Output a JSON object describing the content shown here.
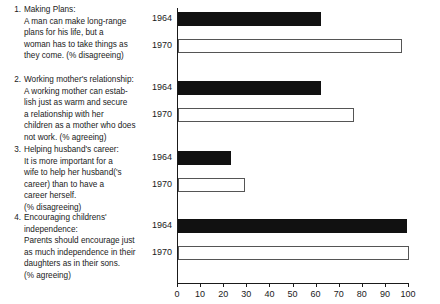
{
  "chart_data": {
    "type": "bar",
    "orientation": "horizontal",
    "title": "",
    "xlabel": "",
    "ylabel": "",
    "xlim": [
      0,
      100
    ],
    "xticks": [
      0,
      10,
      20,
      30,
      40,
      50,
      60,
      70,
      80,
      90,
      100
    ],
    "grid": false,
    "legend": "none",
    "series": [
      {
        "name": "1964",
        "style": "filled",
        "color": "#111111"
      },
      {
        "name": "1970",
        "style": "hollow",
        "color": "#ffffff"
      }
    ],
    "categories": [
      "Making Plans",
      "Working mother's relationship",
      "Helping husband's career",
      "Encouraging childrens' independence"
    ],
    "groups": [
      {
        "number": "1.",
        "title": "Making Plans:",
        "text": "A man can make long-range plans for his life, but a woman has to take things as they come. (% disagreeing)",
        "measure": "% disagreeing",
        "bars": [
          {
            "year": "1964",
            "value": 62,
            "style": "filled"
          },
          {
            "year": "1970",
            "value": 97,
            "style": "hollow"
          }
        ]
      },
      {
        "number": "2.",
        "title": "Working mother's relationship:",
        "text": "A working mother can establish just as warm and secure a relationship with her children as a mother who does not work. (% agreeing)",
        "measure": "% agreeing",
        "bars": [
          {
            "year": "1964",
            "value": 62,
            "style": "filled"
          },
          {
            "year": "1970",
            "value": 76,
            "style": "hollow"
          }
        ]
      },
      {
        "number": "3.",
        "title": "Helping husband's career:",
        "text": "It is more important for a wife to help her husband('s career) than to have a career herself. (% disagreeing)",
        "measure": "% disagreeing",
        "bars": [
          {
            "year": "1964",
            "value": 23,
            "style": "filled"
          },
          {
            "year": "1970",
            "value": 29,
            "style": "hollow"
          }
        ]
      },
      {
        "number": "4.",
        "title": "Encouraging childrens' independence:",
        "text": "Parents should encourage just as much independence in their daughters as in their sons. (% agreeing)",
        "measure": "% agreeing",
        "bars": [
          {
            "year": "1964",
            "value": 99,
            "style": "filled"
          },
          {
            "year": "1970",
            "value": 100,
            "style": "hollow"
          }
        ]
      }
    ]
  },
  "questions": [
    {
      "number": "1.",
      "title": "Making Plans:",
      "lines": [
        "A man can make long-range",
        "plans for his life, but a",
        "woman has to take things as",
        "they come. (% disagreeing)"
      ]
    },
    {
      "number": "2.",
      "title": "Working mother's relationship:",
      "lines": [
        "A working mother can estab-",
        "lish just as warm and secure",
        "a relationship with her",
        "children as a mother who does",
        "not work. (% agreeing)"
      ]
    },
    {
      "number": "3.",
      "title": "Helping husband's career:",
      "lines": [
        "It is more important for a",
        "wife to help her husband('s",
        "career) than to have a",
        "career herself.",
        "(% disagreeing)"
      ]
    },
    {
      "number": "4.",
      "title": "Encouraging childrens'",
      "lines": [
        "independence:",
        "Parents should encourage just",
        "as much independence in their",
        "daughters as in their sons.",
        "(% agreeing)"
      ]
    }
  ],
  "axis": {
    "tick_labels": [
      "0",
      "10",
      "20",
      "30",
      "40",
      "50",
      "60",
      "70",
      "80",
      "90",
      "100"
    ]
  }
}
